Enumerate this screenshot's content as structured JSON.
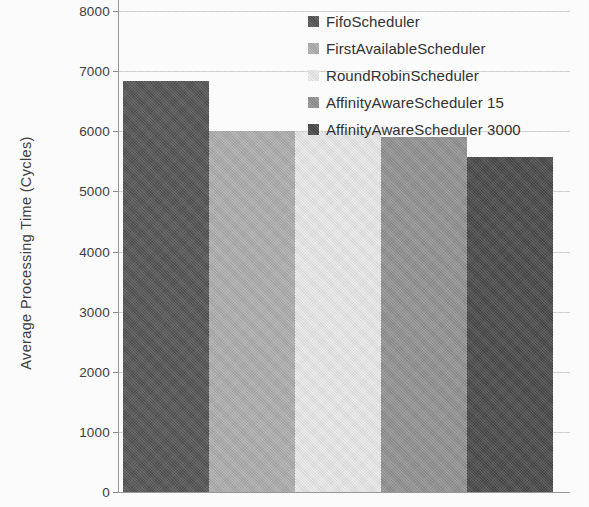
{
  "chart_data": {
    "type": "bar",
    "title": "",
    "xlabel": "",
    "ylabel": "Average Processing Time (Cycles)",
    "ylim": [
      0,
      8000
    ],
    "ytick_labels": [
      "8000",
      "7000",
      "6000",
      "5000",
      "4000",
      "3000",
      "2000",
      "1000",
      "0"
    ],
    "ytick_values": [
      8000,
      7000,
      6000,
      5000,
      4000,
      3000,
      2000,
      1000,
      0
    ],
    "grid": "horizontal-dotted",
    "legend_position": "top-right",
    "categories": [
      "FifoScheduler",
      "FirstAvailableScheduler",
      "RoundRobinScheduler",
      "AffinityAwareScheduler 15",
      "AffinityAwareScheduler 3000"
    ],
    "values": [
      6830,
      6000,
      5980,
      5900,
      5570
    ],
    "colors": [
      "#555555",
      "#b0b0b0",
      "#ececec",
      "#949494",
      "#4a4a4a"
    ]
  },
  "legend": {
    "items": [
      {
        "label": "FifoScheduler",
        "color": "#555555"
      },
      {
        "label": "FirstAvailableScheduler",
        "color": "#b0b0b0"
      },
      {
        "label": "RoundRobinScheduler",
        "color": "#ececec"
      },
      {
        "label": "AffinityAwareScheduler 15",
        "color": "#949494"
      },
      {
        "label": "AffinityAwareScheduler 3000",
        "color": "#4a4a4a"
      }
    ]
  }
}
